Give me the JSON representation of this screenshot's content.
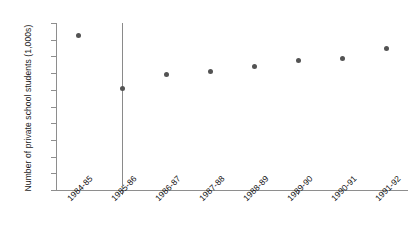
{
  "chart_data": {
    "type": "scatter",
    "title": "",
    "xlabel": "",
    "ylabel": "Number of private school students (1,000s)",
    "categories": [
      "1984-85",
      "1985-86",
      "1986-87",
      "1987-88",
      "1988-89",
      "1989-90",
      "1990-91",
      "1991-92"
    ],
    "values": [
      185,
      122,
      138,
      142,
      148,
      155,
      158,
      170
    ],
    "ylim": [
      0,
      200
    ],
    "yticks": [
      0,
      20,
      40,
      60,
      80,
      100,
      120,
      140,
      160,
      180,
      200
    ],
    "grid": false,
    "legend": null,
    "error_bars": [
      {
        "category": "1985-86",
        "value": 122,
        "low": 0,
        "high": 200
      }
    ],
    "marker_color": "#535353",
    "axis_color": "#8e8e8e",
    "error_bar_color": "#8a8a8a"
  }
}
